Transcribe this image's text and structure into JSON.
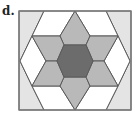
{
  "figure": {
    "label": "d.",
    "colors": {
      "border": "#7a7a7a",
      "line": "#5a5a5a",
      "corner_fill": "#e4e4e4",
      "white_fill": "#ffffff",
      "arm_fill": "#b9b9b9",
      "hexagon_fill": "#6c6c6c"
    },
    "rectangle": {
      "x": 19,
      "y": 11,
      "width": 112,
      "height": 99
    },
    "regions": [
      {
        "name": "left-corner-region",
        "fill": "corner_fill",
        "points": "19,11 44,11 32,36 20,61 32,86 44,110 19,110"
      },
      {
        "name": "right-corner-region",
        "fill": "corner_fill",
        "points": "131,11 106,11 118,36 130,61 118,86 106,110 131,110"
      },
      {
        "name": "top-left-white",
        "fill": "white_fill",
        "points": "44,11 75,11 60,36 32,36"
      },
      {
        "name": "top-right-white",
        "fill": "white_fill",
        "points": "75,11 106,11 118,36 90,36"
      },
      {
        "name": "bottom-left-white",
        "fill": "white_fill",
        "points": "44,110 75,110 60,86 32,86"
      },
      {
        "name": "bottom-right-white",
        "fill": "white_fill",
        "points": "75,110 106,110 118,86 90,86"
      },
      {
        "name": "left-white-diamond",
        "fill": "white_fill",
        "points": "20,61 32,36 46,61 32,86"
      },
      {
        "name": "right-white-diamond",
        "fill": "white_fill",
        "points": "130,61 118,36 104,61 118,86"
      },
      {
        "name": "arm-top",
        "fill": "arm_fill",
        "points": "75,11 90,36 86,45 64,45 60,36"
      },
      {
        "name": "arm-bottom",
        "fill": "arm_fill",
        "points": "75,110 90,86 86,77 64,77 60,86"
      },
      {
        "name": "arm-upper-left",
        "fill": "arm_fill",
        "points": "32,36 60,36 64,45 57,61 46,61"
      },
      {
        "name": "arm-upper-right",
        "fill": "arm_fill",
        "points": "118,36 90,36 86,45 93,61 104,61"
      },
      {
        "name": "arm-lower-left",
        "fill": "arm_fill",
        "points": "32,86 60,86 64,77 57,61 46,61"
      },
      {
        "name": "arm-lower-right",
        "fill": "arm_fill",
        "points": "118,86 90,86 86,77 93,61 104,61"
      },
      {
        "name": "center-hexagon",
        "fill": "hexagon_fill",
        "points": "64,45 86,45 93,61 86,77 64,77 57,61"
      }
    ]
  }
}
